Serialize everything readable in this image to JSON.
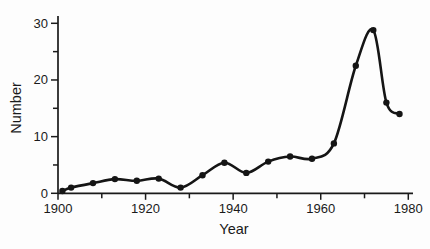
{
  "figure": {
    "background": "#fdfdfd",
    "ink_color": "#1a1a1a"
  },
  "chart_data": {
    "type": "line",
    "title": "",
    "xlabel": "Year",
    "ylabel": "Number",
    "xlim": [
      1900,
      1980
    ],
    "ylim": [
      0,
      30
    ],
    "x_major_ticks": [
      1900,
      1920,
      1940,
      1960,
      1980
    ],
    "x_minor_ticks": [
      1910,
      1930,
      1950,
      1970
    ],
    "y_major_ticks": [
      0,
      10,
      20,
      30
    ],
    "y_minor_ticks": [
      5,
      15,
      25
    ],
    "grid": false,
    "legend": false,
    "line_color": "#151515",
    "marker": "filled-circle",
    "series": [
      {
        "name": "Number",
        "x": [
          1901,
          1903,
          1908,
          1913,
          1918,
          1923,
          1928,
          1933,
          1938,
          1943,
          1948,
          1953,
          1958,
          1963,
          1968,
          1972,
          1975,
          1978
        ],
        "y": [
          0.4,
          1.0,
          1.8,
          2.5,
          2.2,
          2.6,
          1.0,
          3.2,
          5.4,
          3.6,
          5.6,
          6.5,
          6.1,
          8.8,
          22.5,
          28.8,
          16.0,
          14.0
        ]
      }
    ]
  }
}
